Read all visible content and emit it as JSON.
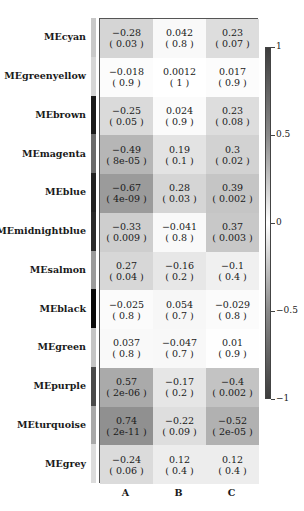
{
  "chart_data": {
    "type": "heatmap",
    "title": "",
    "xlabel": "",
    "ylabel": "",
    "columns": [
      "A",
      "B",
      "C"
    ],
    "rows": [
      "MEcyan",
      "MEgreenyellow",
      "MEbrown",
      "MEmagenta",
      "MEblue",
      "MEmidnightblue",
      "MEsalmon",
      "MEblack",
      "MEgreen",
      "MEpurple",
      "MEturquoise",
      "MEgrey"
    ],
    "row_colors": [
      "#c8c8c8",
      "#d6d6d6",
      "#1a1a1a",
      "#6a6a6a",
      "#222222",
      "#2a2a2a",
      "#9a9a9a",
      "#0a0a0a",
      "#c4c4c4",
      "#4a4a4a",
      "#a8a8a8",
      "#dcdcdc"
    ],
    "values": [
      [
        -0.28,
        0.042,
        0.23
      ],
      [
        -0.018,
        0.0012,
        0.017
      ],
      [
        -0.25,
        0.024,
        0.23
      ],
      [
        -0.49,
        0.19,
        0.3
      ],
      [
        -0.67,
        0.28,
        0.39
      ],
      [
        -0.33,
        -0.041,
        0.37
      ],
      [
        0.27,
        -0.16,
        -0.1
      ],
      [
        -0.025,
        0.054,
        -0.029
      ],
      [
        0.037,
        -0.047,
        0.01
      ],
      [
        0.57,
        -0.17,
        -0.4
      ],
      [
        0.74,
        -0.22,
        -0.52
      ],
      [
        -0.24,
        0.12,
        0.12
      ]
    ],
    "pvalues": [
      [
        "0.03",
        "0.8",
        "0.07"
      ],
      [
        "0.9",
        "1",
        "0.9"
      ],
      [
        "0.05",
        "0.9",
        "0.08"
      ],
      [
        "8e-05",
        "0.1",
        "0.02"
      ],
      [
        "4e-09",
        "0.03",
        "0.002"
      ],
      [
        "0.009",
        "0.8",
        "0.003"
      ],
      [
        "0.04",
        "0.2",
        "0.4"
      ],
      [
        "0.8",
        "0.7",
        "0.8"
      ],
      [
        "0.8",
        "0.7",
        "0.9"
      ],
      [
        "2e-06",
        "0.2",
        "0.002"
      ],
      [
        "2e-11",
        "0.09",
        "2e-05"
      ],
      [
        "0.06",
        "0.4",
        "0.4"
      ]
    ],
    "colorbar": {
      "ticks": [
        "1",
        "0.5",
        "0",
        "-0.5",
        "-1"
      ],
      "range": [
        -1,
        1
      ]
    },
    "grid": false,
    "legend_position": "right"
  }
}
